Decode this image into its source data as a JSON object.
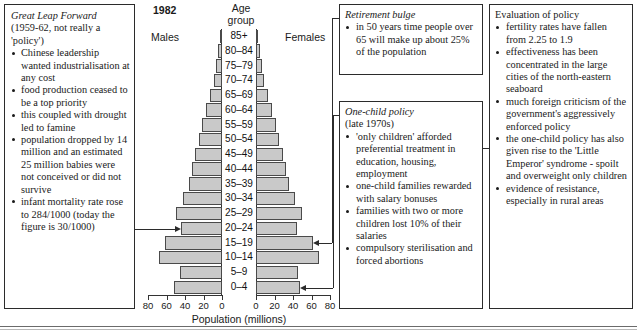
{
  "chart_data": {
    "type": "bar",
    "subtype": "population-pyramid",
    "title": "1982",
    "xlabel": "Population (millions)",
    "ylabel": "Age group",
    "grid": false,
    "legend_position": "top",
    "series_labels": {
      "left": "Males",
      "right": "Females"
    },
    "categories": [
      "85+",
      "80–84",
      "75–79",
      "70–74",
      "65–69",
      "60–64",
      "55–59",
      "50–54",
      "45–49",
      "40–44",
      "35–39",
      "30–34",
      "25–29",
      "20–24",
      "15–19",
      "10–14",
      "5–9",
      "0–4"
    ],
    "xlim": [
      0,
      80
    ],
    "xticks": [
      0,
      20,
      40,
      60,
      80
    ],
    "xticklabels_left": [
      "80",
      "60",
      "40",
      "20",
      "0"
    ],
    "xticklabels_right": [
      "0",
      "20",
      "40",
      "60",
      "80"
    ],
    "series": [
      {
        "name": "Males",
        "values": [
          2,
          4,
          6,
          9,
          13,
          17,
          22,
          25,
          29,
          32,
          36,
          42,
          50,
          44,
          62,
          68,
          45,
          52
        ]
      },
      {
        "name": "Females",
        "values": [
          2,
          4,
          6,
          9,
          13,
          17,
          22,
          25,
          29,
          32,
          36,
          42,
          50,
          44,
          62,
          68,
          45,
          48
        ]
      }
    ],
    "annotations": [
      {
        "label": "Great Leap Forward",
        "points_to": "20–24",
        "side": "left"
      },
      {
        "label": "Retirement bulge",
        "points_to": "15–19",
        "side": "right"
      },
      {
        "label": "One-child policy",
        "points_to": "0–4",
        "side": "right"
      }
    ]
  },
  "left_box": {
    "title": "Great Leap Forward",
    "subtitle": "(1959-62, not really a 'policy')",
    "bullets": [
      "Chinese leadership wanted industrialisation at any cost",
      "food production ceased to be a top priority",
      "this coupled with drought led to famine",
      "population dropped by 14 million and an estimated 25 million babies were not conceived or did not survive",
      "infant mortality rate rose to 284/1000 (today the figure is 30/1000)"
    ]
  },
  "retirement_box": {
    "title": "Retirement bulge",
    "bullets": [
      "in 50 years time people over 65 will make up about 25% of the population"
    ]
  },
  "onechild_box": {
    "title": "One-child policy",
    "subtitle": "(late 1970s)",
    "bullets": [
      "'only children' afforded preferential treatment in education, housing, employment",
      "one-child families rewarded with salary bonuses",
      "families with two or more children lost 10% of their salaries",
      "compulsory sterilisation and forced abortions"
    ]
  },
  "evaluation_box": {
    "title": "Evaluation of policy",
    "bullets": [
      "fertility rates have fallen from 2.25 to 1.9",
      "effectiveness has been concentrated in the large cities of the north-eastern seaboard",
      "much foreign criticism of the government's aggressively enforced policy",
      "the one-child policy has also given rise to the 'Little Emperor' syndrome - spoilt and overweight only children",
      "evidence of resistance, especially in rural areas"
    ]
  },
  "style": {
    "bar_fill": "#c9c9c9",
    "bar_stroke": "#4a4a4a",
    "ink": "#1a1a1a"
  }
}
